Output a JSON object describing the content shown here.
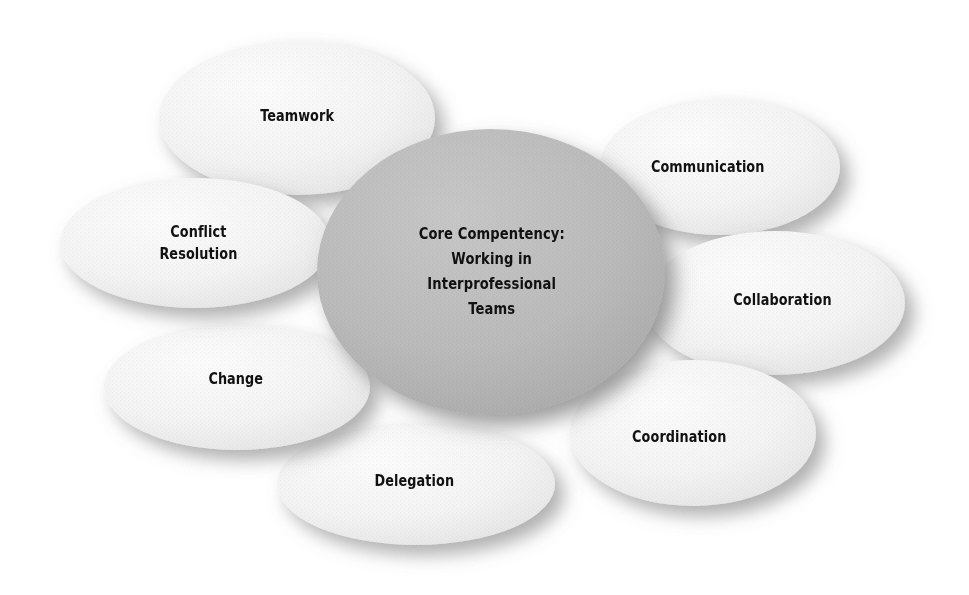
{
  "diagram": {
    "type": "radial-cluster-ellipses",
    "background_color": "#ffffff",
    "center": {
      "id": "core-competency",
      "lines": [
        "Core Compentency:",
        "Working in",
        "Interprofessional",
        "Teams"
      ],
      "text": "Core Compentency: Working in Interprofessional Teams",
      "fill_color": "#b6b6b6",
      "text_color": "#111111",
      "cx": 491,
      "cy": 272,
      "rx": 174,
      "ry": 143
    },
    "satellites": [
      {
        "id": "teamwork",
        "lines": [
          "Teamwork"
        ],
        "text": "Teamwork",
        "fill_color": "#f2f2f2",
        "text_color": "#111111",
        "cx": 297,
        "cy": 118,
        "rx": 138,
        "ry": 77,
        "label_x": 297,
        "label_y": 116
      },
      {
        "id": "communication",
        "lines": [
          "Communication"
        ],
        "text": "Communication",
        "fill_color": "#f2f2f2",
        "text_color": "#111111",
        "cx": 720,
        "cy": 167,
        "rx": 120,
        "ry": 68,
        "label_x": 707,
        "label_y": 167
      },
      {
        "id": "collaboration",
        "lines": [
          "Collaboration"
        ],
        "text": "Collaboration",
        "fill_color": "#f2f2f2",
        "text_color": "#111111",
        "cx": 775,
        "cy": 303,
        "rx": 130,
        "ry": 72,
        "label_x": 782,
        "label_y": 300
      },
      {
        "id": "coordination",
        "lines": [
          "Coordination"
        ],
        "text": "Coordination",
        "fill_color": "#f2f2f2",
        "text_color": "#111111",
        "cx": 693,
        "cy": 433,
        "rx": 123,
        "ry": 73,
        "label_x": 679,
        "label_y": 437
      },
      {
        "id": "delegation",
        "lines": [
          "Delegation"
        ],
        "text": "Delegation",
        "fill_color": "#f2f2f2",
        "text_color": "#111111",
        "cx": 416,
        "cy": 484,
        "rx": 139,
        "ry": 61,
        "label_x": 414,
        "label_y": 481
      },
      {
        "id": "change",
        "lines": [
          "Change"
        ],
        "text": "Change",
        "fill_color": "#f2f2f2",
        "text_color": "#111111",
        "cx": 237,
        "cy": 387,
        "rx": 133,
        "ry": 63,
        "label_x": 236,
        "label_y": 379
      },
      {
        "id": "conflict-resolution",
        "lines": [
          "Conflict",
          "Resolution"
        ],
        "text": "Conflict Resolution",
        "fill_color": "#f2f2f2",
        "text_color": "#111111",
        "cx": 195,
        "cy": 243,
        "rx": 135,
        "ry": 65,
        "label_x": 198,
        "label_y": 243
      }
    ]
  }
}
